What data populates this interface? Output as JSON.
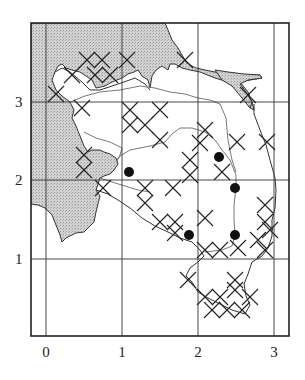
{
  "map": {
    "type": "distribution-grid-map",
    "frame": {
      "x0": 31,
      "y0": 23,
      "x1": 289,
      "y1": 336
    },
    "grid": {
      "x_lines_px": [
        46,
        122,
        198,
        274
      ],
      "y_lines_px": [
        102,
        180,
        259
      ],
      "x_origin_px": 46,
      "x_unit_px": 76,
      "y_origin_px": 337,
      "y_unit_px": 78.5
    },
    "colors": {
      "frame": "#222222",
      "grid": "#333333",
      "land_shade": "#c8c8c8",
      "coast": "#333333",
      "river": "#777777",
      "marker": "#111111"
    }
  },
  "axes": {
    "x_ticks": [
      {
        "label": "0",
        "px": 46
      },
      {
        "label": "1",
        "px": 122
      },
      {
        "label": "2",
        "px": 198
      },
      {
        "label": "3",
        "px": 274
      }
    ],
    "y_ticks": [
      {
        "label": "3",
        "py": 102
      },
      {
        "label": "2",
        "py": 180
      },
      {
        "label": "1",
        "py": 259
      }
    ]
  },
  "legend_symbols": {
    "dot": "filled-circle-record",
    "cross": "x-cross-record",
    "diamond_lattice": "dense-cross-hatched-records"
  },
  "dots": [
    {
      "x": 129,
      "y": 172
    },
    {
      "x": 219,
      "y": 157
    },
    {
      "x": 235,
      "y": 188
    },
    {
      "x": 189,
      "y": 235
    },
    {
      "x": 235,
      "y": 235
    }
  ],
  "crosses": [
    {
      "x": 56,
      "y": 94
    },
    {
      "x": 72,
      "y": 75
    },
    {
      "x": 87,
      "y": 60
    },
    {
      "x": 102,
      "y": 60
    },
    {
      "x": 95,
      "y": 75
    },
    {
      "x": 110,
      "y": 75
    },
    {
      "x": 127,
      "y": 60
    },
    {
      "x": 185,
      "y": 60
    },
    {
      "x": 248,
      "y": 95
    },
    {
      "x": 82,
      "y": 108
    },
    {
      "x": 130,
      "y": 110
    },
    {
      "x": 130,
      "y": 125
    },
    {
      "x": 145,
      "y": 125
    },
    {
      "x": 160,
      "y": 110
    },
    {
      "x": 160,
      "y": 140
    },
    {
      "x": 205,
      "y": 130
    },
    {
      "x": 200,
      "y": 143
    },
    {
      "x": 237,
      "y": 142
    },
    {
      "x": 267,
      "y": 142
    },
    {
      "x": 190,
      "y": 160
    },
    {
      "x": 190,
      "y": 175
    },
    {
      "x": 222,
      "y": 172
    },
    {
      "x": 84,
      "y": 155
    },
    {
      "x": 84,
      "y": 170
    },
    {
      "x": 103,
      "y": 188
    },
    {
      "x": 145,
      "y": 188
    },
    {
      "x": 145,
      "y": 203
    },
    {
      "x": 173,
      "y": 188
    },
    {
      "x": 160,
      "y": 222
    },
    {
      "x": 175,
      "y": 222
    },
    {
      "x": 175,
      "y": 233
    },
    {
      "x": 205,
      "y": 218
    },
    {
      "x": 265,
      "y": 205
    },
    {
      "x": 265,
      "y": 222
    },
    {
      "x": 238,
      "y": 248
    },
    {
      "x": 258,
      "y": 240
    },
    {
      "x": 270,
      "y": 230
    },
    {
      "x": 265,
      "y": 250
    },
    {
      "x": 205,
      "y": 250
    },
    {
      "x": 220,
      "y": 250
    },
    {
      "x": 188,
      "y": 280
    },
    {
      "x": 205,
      "y": 297
    },
    {
      "x": 220,
      "y": 297
    },
    {
      "x": 235,
      "y": 290
    },
    {
      "x": 250,
      "y": 297
    },
    {
      "x": 212,
      "y": 310
    },
    {
      "x": 227,
      "y": 310
    },
    {
      "x": 242,
      "y": 310
    },
    {
      "x": 235,
      "y": 280
    }
  ]
}
